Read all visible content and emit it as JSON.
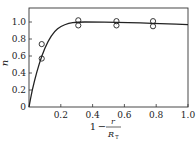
{
  "chart_data": {
    "type": "scatter",
    "title": "",
    "xlabel": "1 - r/R_T",
    "xlabel_parts": {
      "one": "1",
      "minus": "−",
      "num": "r",
      "den": "R",
      "den_sub": "T"
    },
    "ylabel": "n",
    "xlim": [
      0,
      1.0
    ],
    "ylim": [
      0,
      1.15
    ],
    "x_ticks": [
      0.2,
      0.4,
      0.6,
      0.8,
      1.0
    ],
    "x_tick_labels": [
      "0.2",
      "0.4",
      "0.6",
      "0.8",
      "1.0"
    ],
    "y_ticks": [
      0,
      0.2,
      0.4,
      0.6,
      0.8,
      1.0
    ],
    "y_tick_labels": [
      "0",
      "0.2",
      "0.4",
      "0.6",
      "0.8",
      "1.0"
    ],
    "grid": false,
    "legend": null,
    "series": [
      {
        "name": "measured",
        "marker": "open-circle",
        "points": [
          {
            "x": 0.08,
            "y": 0.74
          },
          {
            "x": 0.08,
            "y": 0.57
          },
          {
            "x": 0.31,
            "y": 1.02
          },
          {
            "x": 0.31,
            "y": 0.96
          },
          {
            "x": 0.55,
            "y": 1.01
          },
          {
            "x": 0.55,
            "y": 0.96
          },
          {
            "x": 0.78,
            "y": 1.01
          },
          {
            "x": 0.78,
            "y": 0.95
          }
        ]
      },
      {
        "name": "fitted curve",
        "marker": "line",
        "points": [
          {
            "x": 0.0,
            "y": 0.0
          },
          {
            "x": 0.02,
            "y": 0.2
          },
          {
            "x": 0.05,
            "y": 0.42
          },
          {
            "x": 0.08,
            "y": 0.6
          },
          {
            "x": 0.12,
            "y": 0.78
          },
          {
            "x": 0.16,
            "y": 0.89
          },
          {
            "x": 0.2,
            "y": 0.95
          },
          {
            "x": 0.25,
            "y": 0.985
          },
          {
            "x": 0.3,
            "y": 1.0
          },
          {
            "x": 0.4,
            "y": 1.0
          },
          {
            "x": 0.55,
            "y": 0.995
          },
          {
            "x": 0.7,
            "y": 0.99
          },
          {
            "x": 0.85,
            "y": 0.98
          },
          {
            "x": 1.0,
            "y": 0.97
          }
        ]
      }
    ]
  }
}
